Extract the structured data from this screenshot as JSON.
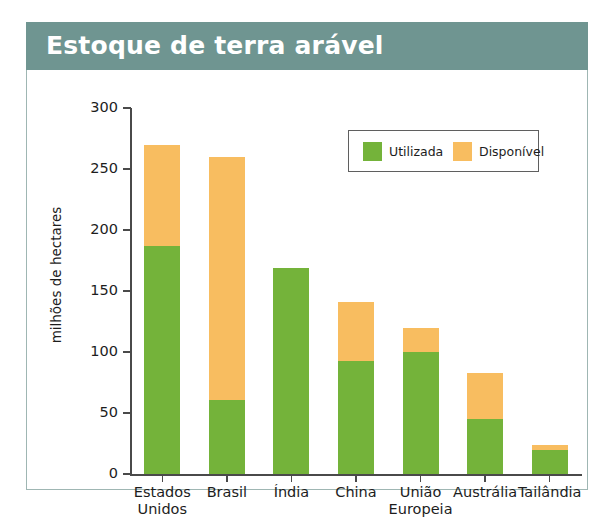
{
  "panel": {
    "title": "Estoque de terra arável",
    "title_bar_color": "#6f9591",
    "frame_border_color": "#9fb6b3"
  },
  "chart_data": {
    "type": "bar",
    "subtype": "stacked-vertical",
    "title": "Estoque de terra arável",
    "xlabel": "",
    "ylabel": "milhões de hectares",
    "ylim": [
      0,
      300
    ],
    "yticks": [
      0,
      50,
      100,
      150,
      200,
      250,
      300
    ],
    "ytick_labels": [
      "0",
      "50",
      "100",
      "150",
      "200",
      "250",
      "300"
    ],
    "grid": false,
    "legend_position": "upper-center-right",
    "categories": [
      "Estados\nUnidos",
      "Brasil",
      "Índia",
      "China",
      "União\nEuropeia",
      "Austrália",
      "Tailândia"
    ],
    "series": [
      {
        "name": "Utilizada",
        "color": "#74b33a",
        "values": [
          187,
          61,
          169,
          93,
          100,
          45,
          20
        ]
      },
      {
        "name": "Disponível",
        "color": "#f8bd60",
        "values": [
          83,
          199,
          0,
          48,
          20,
          38,
          4
        ]
      }
    ],
    "totals": [
      270,
      260,
      169,
      141,
      120,
      83,
      24
    ],
    "legend": [
      {
        "label": "Utilizada",
        "color": "#74b33a"
      },
      {
        "label": "Disponível",
        "color": "#f8bd60"
      }
    ]
  }
}
